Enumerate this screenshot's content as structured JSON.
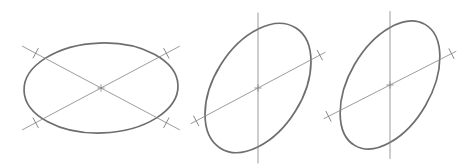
{
  "document": {
    "title": "Ellipse Construction Diagram",
    "background_color": "#ffffff",
    "width": 472,
    "height": 168,
    "description": "Three line-drawn ellipses with construction axis lines and tick marks"
  },
  "style": {
    "ellipse_stroke_color": "#6e6e6e",
    "ellipse_stroke_width": 1.7,
    "axis_stroke_color": "#8a8a8a",
    "axis_stroke_width": 0.85,
    "tick_stroke_color": "#7a7a7a",
    "tick_stroke_width": 0.9
  },
  "figures": [
    {
      "id": "ellipse-1",
      "name": "flat-wide-ellipse",
      "label": "",
      "center": {
        "x": 101,
        "y": 88
      },
      "radius_x": 77,
      "radius_y": 45,
      "rotation_deg": -2,
      "axes": [
        {
          "name": "major-diagonal-axis",
          "angle_deg": 28,
          "length": 178,
          "tick_offsets": [
            -74,
            74
          ]
        },
        {
          "name": "minor-diagonal-axis",
          "angle_deg": -28,
          "length": 178,
          "tick_offsets": [
            -74,
            74
          ]
        }
      ],
      "center_marker": "cross"
    },
    {
      "id": "ellipse-2",
      "name": "tilted-ellipse-left",
      "label": "",
      "center": {
        "x": 258,
        "y": 88
      },
      "radius_x": 44,
      "radius_y": 71,
      "rotation_deg": 32,
      "axes": [
        {
          "name": "vertical-axis",
          "angle_deg": 90,
          "length": 150,
          "tick_offsets": []
        },
        {
          "name": "diagonal-axis",
          "angle_deg": 28,
          "length": 152,
          "tick_offsets": [
            -70,
            70
          ]
        }
      ],
      "center_marker": "cross"
    },
    {
      "id": "ellipse-3",
      "name": "tilted-ellipse-right",
      "label": "",
      "center": {
        "x": 390,
        "y": 85
      },
      "radius_x": 41,
      "radius_y": 70,
      "rotation_deg": 30,
      "axes": [
        {
          "name": "vertical-axis",
          "angle_deg": 90,
          "length": 147,
          "tick_offsets": []
        },
        {
          "name": "diagonal-axis",
          "angle_deg": 27,
          "length": 148,
          "tick_offsets": [
            -69,
            69
          ]
        }
      ],
      "center_marker": "cross"
    }
  ]
}
